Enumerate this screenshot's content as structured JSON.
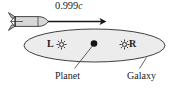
{
  "figure": {
    "name": "relativity-rocket-galaxy-diagram",
    "speed_label": {
      "value": "0.999",
      "unit": "c"
    },
    "galaxy": {
      "caption": "Galaxy",
      "fill_color": "#e9e9e9",
      "stroke_color": "#2a2a2a"
    },
    "planet": {
      "caption": "Planet",
      "color": "#151515"
    },
    "stars": [
      {
        "label": "L",
        "icon": "star-burst-icon"
      },
      {
        "label": "R",
        "icon": "star-burst-icon"
      }
    ],
    "rocket": {
      "icon": "rocket-icon",
      "fill_color": "#d6d6d6",
      "stroke_color": "#2a2a2a"
    },
    "arrow": {
      "icon": "arrow-right-icon",
      "color": "#161616"
    }
  }
}
